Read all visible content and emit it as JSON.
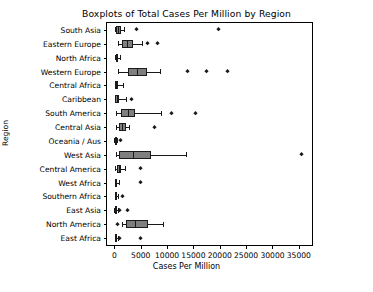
{
  "chart_data": {
    "type": "box",
    "title": "Boxplots of Total Cases Per Million by Region",
    "xlabel": "Cases Per Million",
    "ylabel": "Region",
    "orientation": "horizontal",
    "xlim": [
      -1400,
      37500
    ],
    "grid": false,
    "legend": "none",
    "xticks": [
      0,
      5000,
      10000,
      15000,
      20000,
      25000,
      30000,
      35000
    ],
    "xticklabels": [
      "0",
      "5000",
      "10000",
      "15000",
      "20000",
      "25000",
      "30000",
      "35000"
    ],
    "box_facecolor": "#7f7f7f",
    "box_edgecolor": "#1a1a1a",
    "categories": [
      "South Asia",
      "Eastern Europe",
      "North Africa",
      "Western Europe",
      "Central Africa",
      "Caribbean",
      "South America",
      "Central Asia",
      "Oceania / Aus",
      "West Asia",
      "Central America",
      "West Africa",
      "Southern Africa",
      "East Asia",
      "North America",
      "East Africa"
    ],
    "boxes": [
      {
        "label": "South Asia",
        "whislo": 120,
        "q1": 300,
        "med": 700,
        "q3": 1250,
        "whishi": 1900,
        "fliers": [
          4200,
          19800
        ]
      },
      {
        "label": "Eastern Europe",
        "whislo": 600,
        "q1": 1500,
        "med": 2400,
        "q3": 3500,
        "whishi": 5300,
        "fliers": [
          6300,
          8200
        ]
      },
      {
        "label": "North Africa",
        "whislo": 150,
        "q1": 280,
        "med": 450,
        "q3": 700,
        "whishi": 1000,
        "fliers": []
      },
      {
        "label": "Western Europe",
        "whislo": 600,
        "q1": 2500,
        "med": 4200,
        "q3": 6100,
        "whishi": 8700,
        "fliers": [
          13900,
          17500,
          21500
        ]
      },
      {
        "label": "Central Africa",
        "whislo": 60,
        "q1": 150,
        "med": 400,
        "q3": 750,
        "whishi": 1700,
        "fliers": []
      },
      {
        "label": "Caribbean",
        "whislo": 80,
        "q1": 200,
        "med": 500,
        "q3": 950,
        "whishi": 2200,
        "fliers": [
          3300
        ]
      },
      {
        "label": "South America",
        "whislo": 400,
        "q1": 1300,
        "med": 2600,
        "q3": 4000,
        "whishi": 8900,
        "fliers": [
          10900,
          15400
        ]
      },
      {
        "label": "Central Asia",
        "whislo": 400,
        "q1": 900,
        "med": 1500,
        "q3": 2200,
        "whishi": 2700,
        "fliers": [
          7600
        ]
      },
      {
        "label": "Oceania / Aus",
        "whislo": 20,
        "q1": 60,
        "med": 150,
        "q3": 330,
        "whishi": 520,
        "fliers": [
          1200
        ]
      },
      {
        "label": "West Asia",
        "whislo": 250,
        "q1": 900,
        "med": 3500,
        "q3": 7000,
        "whishi": 13600,
        "fliers": [
          35600
        ]
      },
      {
        "label": "Central America",
        "whislo": 180,
        "q1": 420,
        "med": 800,
        "q3": 1350,
        "whishi": 2000,
        "fliers": [
          5000
        ]
      },
      {
        "label": "West Africa",
        "whislo": 40,
        "q1": 120,
        "med": 300,
        "q3": 560,
        "whishi": 900,
        "fliers": [
          5000
        ]
      },
      {
        "label": "Southern Africa",
        "whislo": 30,
        "q1": 90,
        "med": 220,
        "q3": 480,
        "whishi": 750,
        "fliers": [
          1600
        ]
      },
      {
        "label": "East Asia",
        "whislo": 20,
        "q1": 70,
        "med": 180,
        "q3": 420,
        "whishi": 700,
        "fliers": [
          1000,
          2400
        ]
      },
      {
        "label": "North America",
        "whislo": 1400,
        "q1": 2200,
        "med": 3900,
        "q3": 6400,
        "whishi": 9300,
        "fliers": [
          600
        ]
      },
      {
        "label": "East Africa",
        "whislo": 30,
        "q1": 90,
        "med": 200,
        "q3": 420,
        "whishi": 700,
        "fliers": [
          900,
          5000
        ]
      }
    ]
  }
}
